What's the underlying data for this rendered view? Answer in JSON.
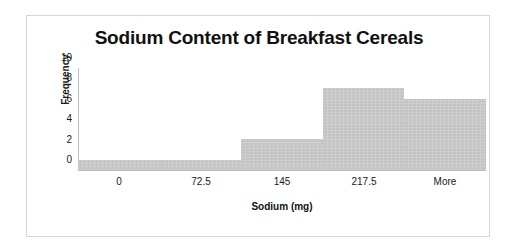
{
  "chart_data": {
    "type": "bar",
    "title": "Sodium Content of Breakfast Cereals",
    "xlabel": "Sodium (mg)",
    "ylabel": "Frequency",
    "categories": [
      "0",
      "72.5",
      "145",
      "217.5",
      "More"
    ],
    "values": [
      1,
      1,
      3,
      8,
      7
    ],
    "yticks": [
      "10",
      "8",
      "6",
      "4",
      "2",
      "0"
    ],
    "ylim": [
      0,
      10
    ],
    "grid": false,
    "legend": false,
    "legend_position": "none",
    "style": {
      "bar_fill": "#c9c9c9",
      "bar_stroke": "#c4c4c4",
      "plot_background": "#ffffff",
      "frame_border": "#d6d6d6",
      "axis_line": "#bdbdbd",
      "text_color": "#1a1a1a",
      "bars_contiguous": true
    }
  },
  "artifacts": {
    "top_fragments": [
      "",
      ""
    ]
  }
}
